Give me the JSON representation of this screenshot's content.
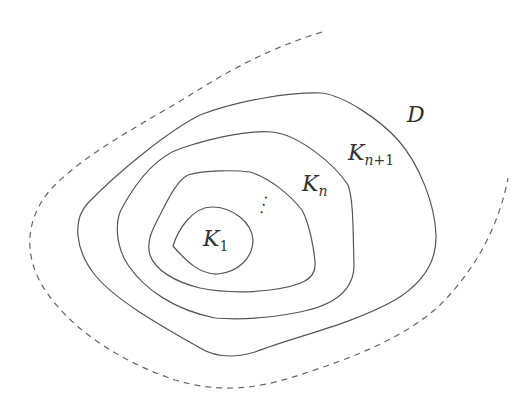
{
  "diagram": {
    "type": "nested-compact-exhaustion",
    "stroke_color": "#555555",
    "background": "#ffffff",
    "labels": {
      "domain": "D",
      "k1_base": "K",
      "k1_sub": "1",
      "kn_base": "K",
      "kn_sub": "n",
      "kn1_base": "K",
      "kn1_sub_var": "n",
      "kn1_sub_rest": "+1",
      "ellipsis": "⋰"
    },
    "curves": [
      {
        "name": "domain-boundary-D",
        "style": "dashed"
      },
      {
        "name": "set-K-n-plus-1",
        "style": "solid"
      },
      {
        "name": "set-K-n",
        "style": "solid"
      },
      {
        "name": "intermediate-set",
        "style": "solid"
      },
      {
        "name": "set-K-1",
        "style": "solid"
      }
    ]
  }
}
